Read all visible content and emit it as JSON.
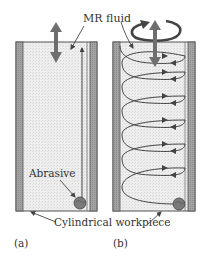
{
  "figure": {
    "panels": [
      {
        "id": "a",
        "label": "(a)",
        "motion": "axial reciprocation"
      },
      {
        "id": "b",
        "label": "(b)",
        "motion": "rotation + axial reciprocation (helical)"
      }
    ],
    "labels": {
      "mr_fluid": "MR fluid",
      "abrasive": "Abrasive",
      "workpiece": "Cylindrical workpiece",
      "panel_a": "(a)",
      "panel_b": "(b)"
    },
    "colors": {
      "wall": "#9a9a9a",
      "wall_border": "#555555",
      "fluid": "#ececec",
      "arrow": "#6e6e6e",
      "line": "#444444",
      "abrasive": "#7a7a7a",
      "text": "#333333"
    },
    "icons": [
      "double-arrow-icon",
      "rotation-arrow-icon",
      "abrasive-particle-icon"
    ]
  }
}
